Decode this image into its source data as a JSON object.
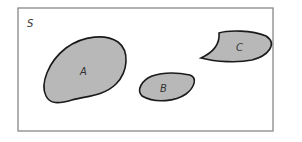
{
  "diagram": {
    "type": "venn",
    "universe": {
      "label": "S",
      "border_color": "#888888",
      "fill": "#ffffff"
    },
    "sets": [
      {
        "label": "A",
        "fill": "#b8b8b8",
        "stroke": "#1a1a1a"
      },
      {
        "label": "B",
        "fill": "#b8b8b8",
        "stroke": "#1a1a1a"
      },
      {
        "label": "C",
        "fill": "#b8b8b8",
        "stroke": "#1a1a1a"
      }
    ],
    "relationship": "mutually disjoint"
  }
}
